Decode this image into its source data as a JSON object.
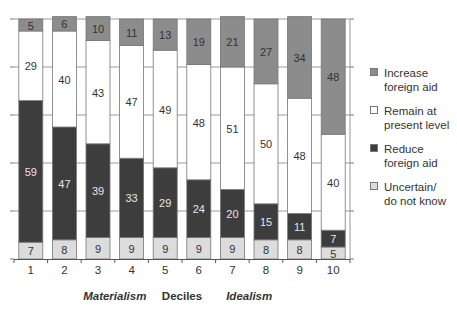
{
  "chart_data": {
    "type": "bar",
    "stacked": true,
    "title": "",
    "xlabel": "Deciles",
    "ylabel": "",
    "ylim": [
      0,
      100
    ],
    "grid": true,
    "legend_position": "right",
    "categories": [
      "1",
      "2",
      "3",
      "4",
      "5",
      "6",
      "7",
      "8",
      "9",
      "10"
    ],
    "x_annotations": [
      {
        "text": "Materialism",
        "under_category": "3.5",
        "style": "bold-italic"
      },
      {
        "text": "Deciles",
        "under_category": "5.5",
        "style": "bold"
      },
      {
        "text": "Idealism",
        "under_category": "7.5",
        "style": "bold-italic"
      }
    ],
    "series": [
      {
        "name": "Uncertain/ do not know",
        "color": "#dcdcdc",
        "label_color": "#333333",
        "values": [
          7,
          8,
          9,
          9,
          9,
          9,
          9,
          8,
          8,
          5
        ]
      },
      {
        "name": "Reduce foreign aid",
        "color": "#3d3d3d",
        "label_color": "#e6e6e6",
        "values": [
          59,
          47,
          39,
          33,
          29,
          24,
          20,
          15,
          11,
          7
        ]
      },
      {
        "name": "Remain at present level",
        "color": "#ffffff",
        "label_color": "#333333",
        "values": [
          29,
          40,
          43,
          47,
          49,
          48,
          51,
          50,
          48,
          40
        ]
      },
      {
        "name": "Increase foreign aid",
        "color": "#8c8c8c",
        "label_color": "#333333",
        "values": [
          5,
          6,
          10,
          11,
          13,
          19,
          21,
          27,
          34,
          48
        ]
      }
    ]
  },
  "legend": {
    "items": [
      {
        "line1": "Increase",
        "line2": "foreign aid",
        "color": "#8c8c8c"
      },
      {
        "line1": "Remain at",
        "line2": "present level",
        "color": "#ffffff"
      },
      {
        "line1": "Reduce",
        "line2": "foreign aid",
        "color": "#3d3d3d"
      },
      {
        "line1": "Uncertain/",
        "line2": "do not know",
        "color": "#dcdcdc"
      }
    ]
  }
}
